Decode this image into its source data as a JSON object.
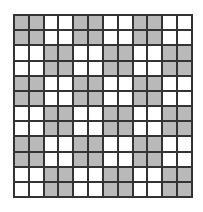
{
  "grid": {
    "rows": 12,
    "cols": 12,
    "colors": {
      "shaded": "#b9b9b9",
      "empty": "#ffffff",
      "line": "#333333"
    },
    "cells": [
      [
        1,
        1,
        0,
        0,
        1,
        1,
        0,
        0,
        1,
        1,
        0,
        0
      ],
      [
        1,
        1,
        0,
        0,
        1,
        1,
        0,
        0,
        1,
        1,
        0,
        0
      ],
      [
        0,
        0,
        1,
        1,
        0,
        0,
        1,
        1,
        0,
        0,
        1,
        1
      ],
      [
        0,
        0,
        1,
        1,
        0,
        0,
        1,
        1,
        0,
        0,
        1,
        1
      ],
      [
        1,
        1,
        0,
        0,
        1,
        1,
        0,
        0,
        1,
        1,
        0,
        0
      ],
      [
        1,
        1,
        0,
        0,
        1,
        1,
        0,
        0,
        1,
        1,
        0,
        0
      ],
      [
        0,
        0,
        1,
        1,
        0,
        0,
        1,
        1,
        0,
        0,
        1,
        1
      ],
      [
        0,
        0,
        1,
        1,
        0,
        0,
        1,
        1,
        0,
        0,
        1,
        1
      ],
      [
        1,
        1,
        0,
        0,
        1,
        1,
        0,
        0,
        1,
        1,
        0,
        0
      ],
      [
        1,
        1,
        0,
        0,
        1,
        1,
        0,
        0,
        1,
        1,
        0,
        0
      ],
      [
        0,
        0,
        1,
        1,
        0,
        0,
        1,
        1,
        0,
        0,
        1,
        1
      ],
      [
        0,
        0,
        1,
        1,
        0,
        0,
        1,
        1,
        0,
        0,
        1,
        1
      ]
    ]
  }
}
